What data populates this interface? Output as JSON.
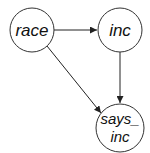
{
  "diagram": {
    "type": "directed-graph",
    "nodes": [
      {
        "id": "race",
        "label": "race",
        "cx": 32,
        "cy": 30,
        "r": 22
      },
      {
        "id": "inc",
        "label": "inc",
        "cx": 120,
        "cy": 30,
        "r": 22
      },
      {
        "id": "says_inc",
        "label_line1": "says_",
        "label_line2": "inc",
        "cx": 120,
        "cy": 128,
        "r": 24
      }
    ],
    "edges": [
      {
        "from": "race",
        "to": "inc"
      },
      {
        "from": "inc",
        "to": "says_inc"
      },
      {
        "from": "race",
        "to": "says_inc"
      }
    ],
    "colors": {
      "stroke": "#333333",
      "text": "#111111",
      "background": "#ffffff"
    }
  }
}
